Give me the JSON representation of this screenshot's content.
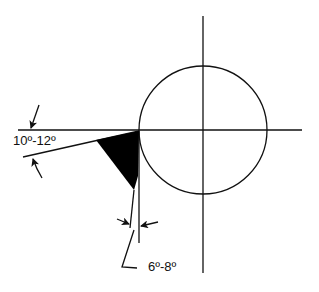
{
  "diagram": {
    "type": "tool-angle-geometry",
    "labels": {
      "top_angle": "10º-12º",
      "bottom_angle": "6º-8º"
    },
    "colors": {
      "ink": "#111111",
      "fill": "#000000",
      "background": "#ffffff"
    },
    "elements": {
      "circle": {
        "cx": 203,
        "cy": 130,
        "r": 64
      },
      "horizontal_axis": {
        "x1": 18,
        "x2": 302,
        "y": 130
      },
      "vertical_axis": {
        "x": 203,
        "y1": 16,
        "y2": 273
      },
      "cutting_tool": "black wedge tangent to left of circle"
    }
  }
}
